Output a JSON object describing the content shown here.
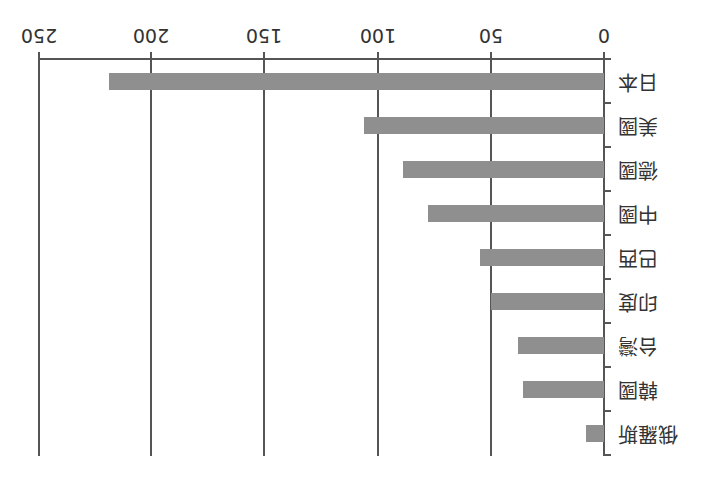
{
  "chart_data": {
    "type": "bar",
    "orientation": "horizontal",
    "rotation_deg": 180,
    "title": "",
    "xlabel": "",
    "ylabel": "",
    "categories": [
      "日本",
      "美國",
      "德國",
      "中國",
      "巴西",
      "印度",
      "台灣",
      "韓國",
      "俄羅斯"
    ],
    "values": [
      219,
      106,
      89,
      78,
      55,
      50,
      38,
      36,
      8
    ],
    "xlim": [
      0,
      250
    ],
    "xticks": [
      "0",
      "50",
      "100",
      "150",
      "200",
      "250"
    ],
    "grid": true,
    "legend": null,
    "bar_color": "#8f8f8f"
  }
}
